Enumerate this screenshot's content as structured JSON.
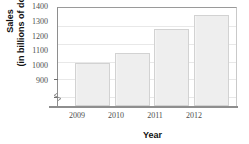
{
  "chart_data": {
    "type": "bar",
    "title": "",
    "xlabel": "Year",
    "ylabel_line1": "Sales",
    "ylabel_line2": "(in billions of dollars)",
    "categories": [
      "2009",
      "2010",
      "2011",
      "2012"
    ],
    "values": [
      1085,
      1140,
      1275,
      1358
    ],
    "ytick_labels": [
      "1400",
      "1300",
      "1200",
      "1100",
      "1000",
      "900"
    ],
    "ytick_values": [
      1400,
      1300,
      1200,
      1100,
      1000,
      900
    ],
    "ylim": [
      845,
      1400
    ],
    "axis_break": true,
    "grid": true,
    "legend": "none",
    "bar_fill": "#eeeeee",
    "bar_border": "#d2d2d2",
    "gridline_color": "#e8e8e8",
    "axis_color": "#8e8e8e",
    "text_color": "#4d4d4d"
  }
}
